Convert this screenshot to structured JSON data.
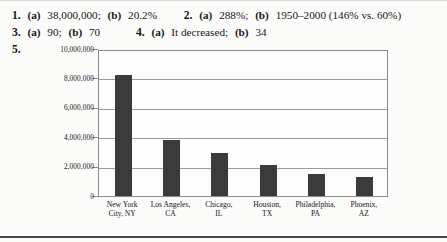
{
  "answers": [
    {
      "items": [
        {
          "number": "1.",
          "parts": [
            {
              "label": "(a)",
              "value": "38,000,000;"
            },
            {
              "label": "(b)",
              "value": "20.2%"
            }
          ]
        },
        {
          "number": "2.",
          "parts": [
            {
              "label": "(a)",
              "value": "288%;"
            },
            {
              "label": "(b)",
              "value": "1950–2000 (146% vs. 60%)"
            }
          ]
        }
      ]
    },
    {
      "items": [
        {
          "number": "3.",
          "parts": [
            {
              "label": "(a)",
              "value": "90;"
            },
            {
              "label": "(b)",
              "value": "70"
            }
          ]
        },
        {
          "number": "4.",
          "parts": [
            {
              "label": "(a)",
              "value": "It decreased;"
            },
            {
              "label": "(b)",
              "value": "34"
            }
          ]
        }
      ]
    }
  ],
  "item5": {
    "number": "5."
  },
  "chart_data": {
    "type": "bar",
    "title": "",
    "xlabel": "",
    "ylabel": "",
    "ylim": [
      0,
      10000000
    ],
    "grid": true,
    "legend": "none",
    "categories": [
      "New York City, NY",
      "Los Angeles, CA",
      "Chicago, IL",
      "Houston, TX",
      "Philadelphia, PA",
      "Phoenix, AZ"
    ],
    "category_lines": [
      [
        "New York",
        "City, NY"
      ],
      [
        "Los Angeles,",
        "CA"
      ],
      [
        "Chicago,",
        "IL"
      ],
      [
        "Houston,",
        "TX"
      ],
      [
        "Philadelphia,",
        "PA"
      ],
      [
        "Phoenix,",
        "AZ"
      ]
    ],
    "values": [
      8200000,
      3800000,
      2900000,
      2100000,
      1500000,
      1300000
    ],
    "ytick_labels": [
      "10,000,000",
      "8,000,000",
      "6,000,000",
      "4,000,000",
      "2,000,000",
      "0"
    ],
    "ytick_values": [
      10000000,
      8000000,
      6000000,
      4000000,
      2000000,
      0
    ],
    "bar_color": "#3b3b3b",
    "axis_color": "#8a8a8a",
    "grid_color": "#9a9a9a"
  }
}
